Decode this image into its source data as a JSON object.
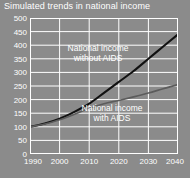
{
  "chart_data": {
    "type": "line",
    "title": "Simulated trends in national income",
    "xlabel": "",
    "ylabel": "",
    "xlim": [
      1990,
      2040
    ],
    "ylim": [
      0,
      500
    ],
    "grid": true,
    "legend_position": "inline-annotations",
    "x_ticks": [
      "1990",
      "2000",
      "2010",
      "2020",
      "2030",
      "2040"
    ],
    "x_tick_values": [
      1990,
      2000,
      2010,
      2020,
      2030,
      2040
    ],
    "y_ticks": [
      "0",
      "50",
      "100",
      "150",
      "200",
      "250",
      "300",
      "350",
      "400",
      "450",
      "500"
    ],
    "y_tick_values": [
      0,
      50,
      100,
      150,
      200,
      250,
      300,
      350,
      400,
      450,
      500
    ],
    "x": [
      1990,
      1995,
      2000,
      2005,
      2010,
      2015,
      2020,
      2025,
      2030,
      2035,
      2040
    ],
    "series": [
      {
        "name": "National income without AIDS",
        "values": [
          100,
          112,
          130,
          155,
          185,
          225,
          265,
          305,
          350,
          395,
          440
        ],
        "color": "#111111",
        "width": 2.1
      },
      {
        "name": "National income with AIDS",
        "values": [
          100,
          110,
          126,
          146,
          168,
          185,
          197,
          210,
          224,
          240,
          255
        ],
        "color": "#5c5c5c",
        "width": 1.6
      }
    ],
    "annotations": [
      {
        "name": "without-aids-label",
        "line1": "National income",
        "line2": "without AIDS"
      },
      {
        "name": "with-aids-label",
        "line1": "National income",
        "line2": "with AIDS"
      }
    ],
    "colors": {
      "background": "#8b8b8b",
      "grid": "#ffffff",
      "frame": "#ffffff",
      "text": "#ffffff"
    }
  }
}
